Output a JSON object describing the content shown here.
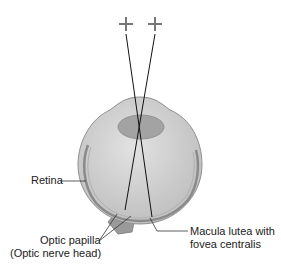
{
  "diagram": {
    "type": "anatomical-eye-cross-section",
    "fixation_points": [
      "+",
      "+"
    ],
    "labels": {
      "retina": "Retina",
      "optic_papilla_line1": "Optic papilla",
      "optic_papilla_line2": "(Optic nerve head)",
      "macula_line1": "Macula lutea with",
      "macula_line2": "fovea centralis"
    },
    "colors": {
      "eyeball": "#c9c9c9",
      "eyeball_inner": "#d6d6d6",
      "lens": "#9e9e9e",
      "retina": "#8a8a8a",
      "rays": "#111111",
      "cross": "#777777"
    }
  }
}
